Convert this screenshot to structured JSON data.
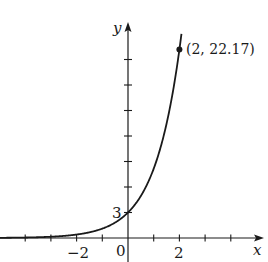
{
  "chart_data": {
    "type": "line",
    "title": "",
    "function": "y = 3e^x",
    "xlabel": "x",
    "ylabel": "y",
    "xlim": [
      -5,
      5.2
    ],
    "ylim": [
      -2.8,
      25.5
    ],
    "grid": false,
    "legend": null,
    "x_ticks": [
      -4,
      -3,
      -2,
      -1,
      0,
      1,
      2,
      3,
      4
    ],
    "x_tick_labels": [
      {
        "value": -2,
        "label": "−2"
      },
      {
        "value": 0,
        "label": "0"
      },
      {
        "value": 2,
        "label": "2"
      }
    ],
    "y_ticks": [
      3,
      6,
      9,
      12,
      15,
      18,
      21
    ],
    "y_tick_labels": [
      {
        "value": 3,
        "label": "3"
      }
    ],
    "series": [
      {
        "name": "y = 3e^x",
        "x": [
          -5,
          -4,
          -3,
          -2,
          -1,
          -0.5,
          0,
          0.5,
          1,
          1.5,
          2,
          2.09
        ],
        "y": [
          0.02,
          0.055,
          0.149,
          0.406,
          1.104,
          1.82,
          3,
          4.95,
          8.15,
          13.45,
          22.17,
          24.26
        ]
      }
    ],
    "points": [
      {
        "x": 2,
        "y": 22.17,
        "label": "(2, 22.17)"
      }
    ],
    "annotations": [
      {
        "text": "(2, 22.17)",
        "at": [
          2,
          22.17
        ]
      },
      {
        "text": "3",
        "at": [
          0,
          3
        ]
      }
    ]
  },
  "labels": {
    "x_axis": "x",
    "y_axis": "y",
    "origin": "0",
    "tick_neg2": "−2",
    "tick_2": "2",
    "y_intercept": "3",
    "point_label": "(2, 22.17)"
  }
}
